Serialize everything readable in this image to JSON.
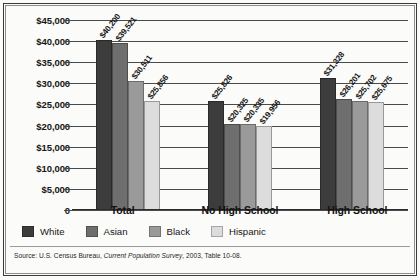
{
  "chart_data": {
    "type": "bar",
    "title": "",
    "xlabel": "",
    "ylabel": "",
    "ylim": [
      0,
      45000
    ],
    "grid": true,
    "legend_position": "bottom-left",
    "categories": [
      "Total",
      "No High School",
      "High School"
    ],
    "ytick_labels": [
      "$45,000",
      "$40,000",
      "$35,000",
      "$30,000",
      "$25,000",
      "$20,000",
      "$15,000",
      "$10,000",
      "$5,000",
      "0"
    ],
    "ytick_values": [
      45000,
      40000,
      35000,
      30000,
      25000,
      20000,
      15000,
      10000,
      5000,
      0
    ],
    "series": [
      {
        "name": "White",
        "color": "#3c3c3c",
        "values": [
          40200,
          25826,
          31328
        ],
        "labels": [
          "$40,200",
          "$25,826",
          "$31,328"
        ]
      },
      {
        "name": "Asian",
        "color": "#6e6e6e",
        "values": [
          39521,
          20325,
          26201
        ],
        "labels": [
          "$39,521",
          "$20,325",
          "$26,201"
        ]
      },
      {
        "name": "Black",
        "color": "#9a9a9a",
        "values": [
          30511,
          20335,
          25702
        ],
        "labels": [
          "$30,511",
          "$20,335",
          "$25,702"
        ]
      },
      {
        "name": "Hispanic",
        "color": "#dcdcdc",
        "values": [
          25856,
          19956,
          25675
        ],
        "labels": [
          "$25,856",
          "$19,956",
          "$25,675"
        ]
      }
    ]
  },
  "source": {
    "prefix": "Source: U.S. Census Bureau,",
    "italic": "Current Population Survey",
    "suffix": ", 2003, Table 10-08."
  }
}
